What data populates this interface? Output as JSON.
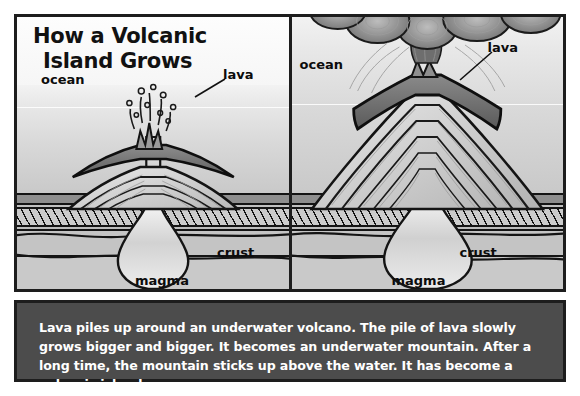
{
  "figure": {
    "title_line1": "How a Volcanic",
    "title_line2": "Island Grows",
    "caption": "Lava piles up around an underwater volcano.  The pile of lava slowly grows bigger and bigger.  It becomes an underwater mountain.  After a long time, the mountain sticks up above the water.  It has become a volcanic island."
  },
  "panels": [
    {
      "id": "stage-1-underwater-volcano",
      "labels": {
        "ocean": "ocean",
        "lava": "lava",
        "crust": "crust",
        "magma": "magma"
      }
    },
    {
      "id": "stage-2-volcanic-island",
      "labels": {
        "ocean": "ocean",
        "lava": "lava",
        "crust": "crust",
        "magma": "magma"
      }
    }
  ],
  "colors": {
    "frame": "#1d1d1d",
    "caption_bg": "#4c4c4c",
    "caption_text": "#ffffff",
    "page_bg": "#ffffff",
    "ink": "#111111"
  }
}
